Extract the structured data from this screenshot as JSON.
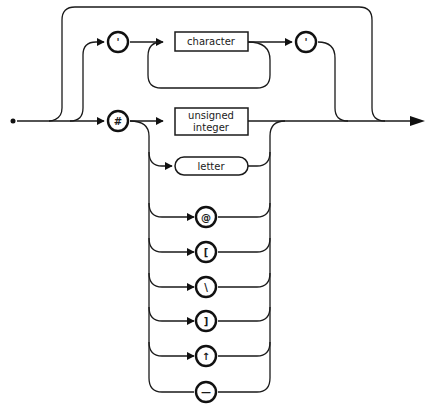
{
  "diagram": {
    "type": "syntax-railroad-diagram",
    "quote_open": "'",
    "quote_close": "'",
    "nonterminal_character": "character",
    "hash_symbol": "#",
    "nonterminal_unsigned_1": "unsigned",
    "nonterminal_unsigned_2": "integer",
    "nonterminal_letter": "letter",
    "terminals": {
      "at": "@",
      "lbracket": "[",
      "backslash": "\\",
      "rbracket": "]",
      "uparrow": "↑",
      "dash": "—"
    }
  }
}
